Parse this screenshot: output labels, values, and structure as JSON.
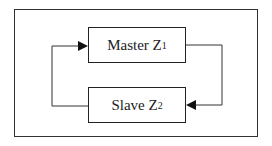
{
  "diagram": {
    "nodes": [
      {
        "id": "master",
        "label": "Master Z",
        "subscript": "1"
      },
      {
        "id": "slave",
        "label": "Slave Z",
        "subscript": "2"
      }
    ],
    "edges": [
      {
        "from": "master",
        "to": "slave",
        "route": "right-loop",
        "arrow": "at-slave-right"
      },
      {
        "from": "slave",
        "to": "master",
        "route": "left-loop",
        "arrow": "at-master-left"
      }
    ],
    "colors": {
      "line": "#222222",
      "background": "#ffffff"
    }
  }
}
